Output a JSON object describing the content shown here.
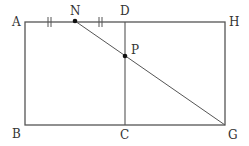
{
  "diagram": {
    "type": "geometry",
    "points": {
      "A": {
        "label": "A",
        "x": 25,
        "y": 22
      },
      "N": {
        "label": "N",
        "x": 75,
        "y": 21
      },
      "D": {
        "label": "D",
        "x": 125,
        "y": 22
      },
      "H": {
        "label": "H",
        "x": 225,
        "y": 22
      },
      "B": {
        "label": "B",
        "x": 25,
        "y": 125
      },
      "C": {
        "label": "C",
        "x": 125,
        "y": 125
      },
      "G": {
        "label": "G",
        "x": 225,
        "y": 125
      },
      "P": {
        "label": "P",
        "x": 125,
        "y": 56
      }
    },
    "segments": [
      [
        "A",
        "H"
      ],
      [
        "H",
        "G"
      ],
      [
        "G",
        "B"
      ],
      [
        "B",
        "A"
      ],
      [
        "D",
        "C"
      ],
      [
        "N",
        "G"
      ]
    ],
    "marked_points": [
      "N",
      "P"
    ],
    "equal_marks": [
      [
        "A",
        "N"
      ],
      [
        "N",
        "D"
      ]
    ],
    "colors": {
      "line": "#555555",
      "point": "#111111",
      "label": "#333333"
    }
  }
}
